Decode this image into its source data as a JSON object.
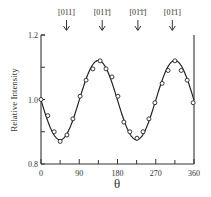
{
  "chart_data": {
    "type": "line",
    "title": "",
    "xlabel": "θ",
    "ylabel": "Relative Intensity",
    "xlim": [
      0,
      360
    ],
    "ylim": [
      0.8,
      1.2
    ],
    "xticks": [
      0,
      90,
      180,
      270,
      360
    ],
    "xminor_ticks": [
      45,
      135,
      225,
      315
    ],
    "yticks": [
      0.8,
      1.0,
      1.2
    ],
    "yminor_ticks": [
      0.9,
      1.1
    ],
    "grid": false,
    "legend": null,
    "annotations": [
      {
        "label": "[011]",
        "x": 60
      },
      {
        "label": "[011̄]",
        "x": 144
      },
      {
        "label": "[01̄1̄]",
        "x": 228
      },
      {
        "label": "[01̄1]",
        "x": 309
      }
    ],
    "series": [
      {
        "name": "measured",
        "style": "open-circles",
        "x": [
          0,
          16,
          31,
          45,
          61,
          75,
          92,
          106,
          122,
          139,
          153,
          167,
          181,
          195,
          209,
          226,
          240,
          254,
          268,
          285,
          299,
          315,
          330,
          344,
          358
        ],
        "values": [
          1.0,
          0.95,
          0.9,
          0.87,
          0.89,
          0.94,
          1.01,
          1.06,
          1.095,
          1.12,
          1.095,
          1.07,
          1.01,
          0.93,
          0.9,
          0.88,
          0.9,
          0.94,
          0.99,
          1.05,
          1.09,
          1.12,
          1.09,
          1.06,
          0.99
        ]
      },
      {
        "name": "fit",
        "style": "solid-line",
        "function": "1.0 + 0.12*sin(2*(θ - 90°))-like sinusoid, period 180°, min 0.875 near 45°/225°, max 1.12 near 135°/315°"
      }
    ]
  },
  "labels": {
    "xlabel": "θ",
    "ylabel": "Relative Intensity",
    "xticks": [
      "0",
      "90",
      "180",
      "270",
      "360"
    ],
    "yticks": [
      "0.8",
      "1.0",
      "1.2"
    ],
    "arrows": [
      "[011]",
      "[011̄]",
      "[01̄1̄]",
      "[01̄1]"
    ]
  }
}
